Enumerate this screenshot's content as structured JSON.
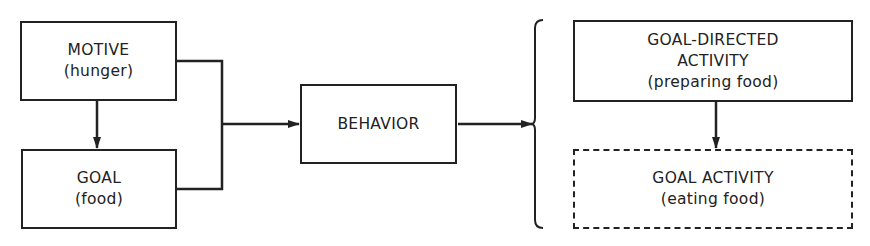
{
  "diagram": {
    "nodes": {
      "motive": {
        "title": "MOTIVE",
        "subtitle": "(hunger)"
      },
      "goal": {
        "title": "GOAL",
        "subtitle": "(food)"
      },
      "behavior": {
        "title": "BEHAVIOR"
      },
      "goal_directed": {
        "title_line1": "GOAL-DIRECTED",
        "title_line2": "ACTIVITY",
        "subtitle": "(preparing food)"
      },
      "goal_activity": {
        "title": "GOAL ACTIVITY",
        "subtitle": "(eating food)"
      }
    },
    "edges": [
      {
        "from": "motive",
        "to": "goal"
      },
      {
        "from": "motive+goal",
        "to": "behavior"
      },
      {
        "from": "behavior",
        "to": "goal_directed+goal_activity"
      },
      {
        "from": "goal_directed",
        "to": "goal_activity"
      }
    ]
  }
}
